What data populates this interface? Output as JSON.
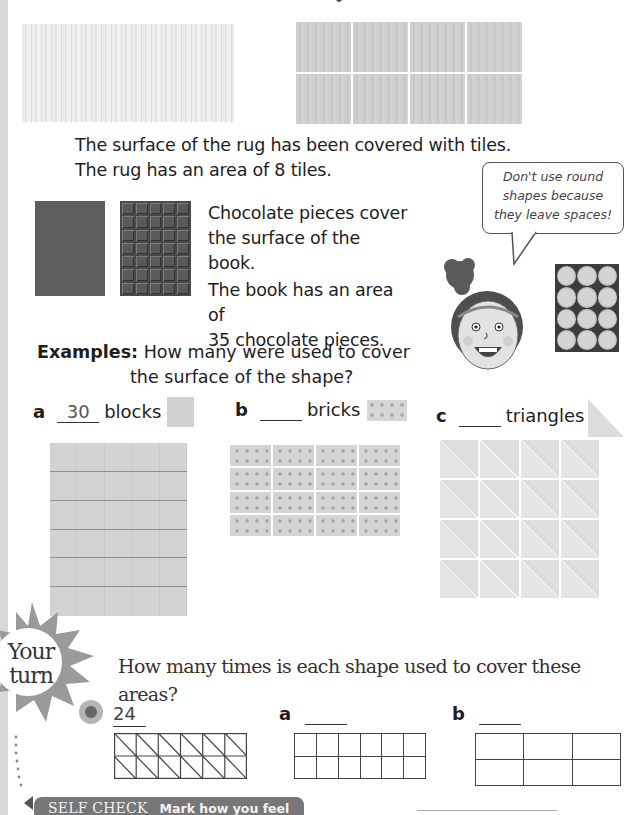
{
  "page": {
    "intro": {
      "rug_caption_line1": "The surface of the rug has been covered with tiles.",
      "rug_caption_line2": "The rug has an area of 8 tiles.",
      "rug_tiles": {
        "columns": 4,
        "rows": 2,
        "total": 8
      }
    },
    "book": {
      "caption_line1": "Chocolate pieces cover",
      "caption_line2": "the surface of the book.",
      "caption_line3": "The book has an area of",
      "caption_line4": "35 chocolate pieces.",
      "chocolate_grid": {
        "columns": 5,
        "rows": 7,
        "total": 35
      }
    },
    "speech_bubble": {
      "line1": "Don't use round",
      "line2": "shapes because",
      "line3": "they leave spaces!"
    },
    "coin_grid": {
      "columns": 3,
      "rows": 4
    },
    "examples": {
      "label": "Examples:",
      "question_line1": "How many were used to cover",
      "question_line2": "the surface of the shape?",
      "items": [
        {
          "letter": "a",
          "answer": "30",
          "unit": "blocks",
          "grid": {
            "columns": 5,
            "rows": 6
          }
        },
        {
          "letter": "b",
          "answer": "",
          "unit": "bricks",
          "grid": {
            "columns": 4,
            "rows": 4
          }
        },
        {
          "letter": "c",
          "answer": "",
          "unit": "triangles",
          "grid": {
            "columns": 4,
            "rows": 4
          }
        }
      ]
    },
    "your_turn": {
      "badge_line1": "Your",
      "badge_line2": "turn",
      "question": "How many times is each shape used to cover these areas?",
      "items": [
        {
          "letter": "",
          "answer": "24",
          "grid": {
            "columns": 6,
            "rows": 2,
            "diagonals": true
          }
        },
        {
          "letter": "a",
          "answer": "",
          "grid": {
            "columns": 6,
            "rows": 2
          }
        },
        {
          "letter": "b",
          "answer": "",
          "grid": {
            "columns": 3,
            "rows": 2
          }
        }
      ]
    },
    "self_check": {
      "title": "SELF CHECK",
      "subtitle": "Mark how you feel"
    }
  },
  "colors": {
    "text": "#1e1e1e",
    "banner": "#777777",
    "chocolate": "#4a4a4a",
    "book": "#5e5e5e",
    "block": "#d3d3d3"
  }
}
